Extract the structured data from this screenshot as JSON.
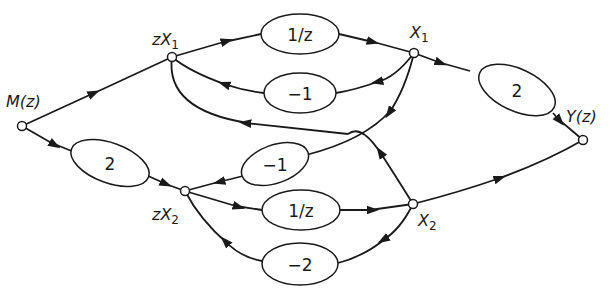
{
  "diagram": {
    "type": "signal-flow-graph",
    "nodes": {
      "m": {
        "label": "M(z)",
        "x": 22,
        "y": 126
      },
      "zx1": {
        "label_main": "zX",
        "label_sub": "1",
        "x": 172,
        "y": 57
      },
      "x1": {
        "label_main": "X",
        "label_sub": "1",
        "x": 414,
        "y": 53
      },
      "y": {
        "label": "Y(z)",
        "x": 583,
        "y": 140
      },
      "zx2": {
        "label_main": "zX",
        "label_sub": "2",
        "x": 185,
        "y": 191
      },
      "x2": {
        "label_main": "X",
        "label_sub": "2",
        "x": 413,
        "y": 204
      }
    },
    "gains": {
      "top_delay": "1/z",
      "top_feedback": "−1",
      "output_x1": "2",
      "input_x2": "2",
      "cross_feedback": "−1",
      "bottom_delay": "1/z",
      "bottom_feedback": "−2"
    },
    "edges": [
      {
        "from": "M(z)",
        "to": "zX1",
        "gain": "1"
      },
      {
        "from": "M(z)",
        "to": "zX2",
        "gain": "2"
      },
      {
        "from": "zX1",
        "to": "X1",
        "gain": "1/z"
      },
      {
        "from": "X1",
        "to": "zX1",
        "gain": "−1"
      },
      {
        "from": "X1",
        "to": "Y(z)",
        "gain": "2"
      },
      {
        "from": "X1",
        "to": "zX2",
        "gain": "−1"
      },
      {
        "from": "X2",
        "to": "zX1",
        "gain": "1"
      },
      {
        "from": "zX2",
        "to": "X2",
        "gain": "1/z"
      },
      {
        "from": "X2",
        "to": "zX2",
        "gain": "−2"
      },
      {
        "from": "X2",
        "to": "Y(z)",
        "gain": "1"
      }
    ]
  }
}
